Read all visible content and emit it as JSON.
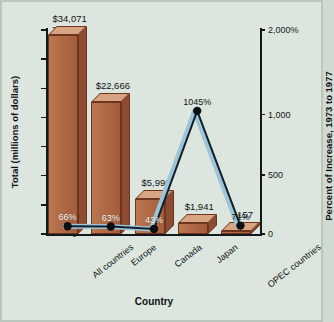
{
  "chart_data": {
    "type": "bar",
    "title": "",
    "categories": [
      "All countries",
      "Europe",
      "Canada",
      "Japan",
      "OPEC countries"
    ],
    "xlabel": "Country",
    "ylabel": "Total (millions of dollars)",
    "y2label": "Percent of Increase, 1973 to 1977",
    "ylim": [
      0,
      35000
    ],
    "y2lim": [
      0,
      2000
    ],
    "grid": false,
    "legend": "none",
    "yticks": [
      0,
      5000,
      10000,
      15000,
      20000,
      25000,
      30000,
      35000
    ],
    "ytick_labels": [
      "0",
      "5000",
      "10000",
      "15000",
      "20000",
      "25000",
      "30000",
      "35000"
    ],
    "y2ticks": [
      0,
      500,
      1000,
      2000
    ],
    "y2tick_labels": [
      "0",
      "500",
      "1,000",
      "2,000%"
    ],
    "series": [
      {
        "name": "Total (millions of dollars)",
        "type": "bar",
        "axis": "left",
        "values": [
          34071,
          22666,
          5999,
          1941,
          157
        ],
        "value_labels": [
          "$34,071",
          "$22,666",
          "$5,999",
          "$1,941",
          "$157"
        ],
        "color": "#b06a46"
      },
      {
        "name": "Percent of Increase, 1973 to 1977",
        "type": "line",
        "axis": "right",
        "values": [
          66,
          63,
          43,
          1045,
          71
        ],
        "value_labels": [
          "66%",
          "63%",
          "43%",
          "1045%",
          "71%"
        ],
        "color": "#13202b",
        "marker_color": "#0c0f12",
        "shadow_color": "#9dc5d8"
      }
    ]
  },
  "colors": {
    "background": "#dce6de",
    "frame_border": "#b9c6bc",
    "axis": "#14181a",
    "bar_front": "#b06a46",
    "bar_top": "#d7a581",
    "bar_side": "#8e4c32",
    "bar_outline": "#6d3420",
    "line": "#13202b",
    "line_highlight": "#9dc5d8",
    "in_bar_text": "#ffffff"
  }
}
